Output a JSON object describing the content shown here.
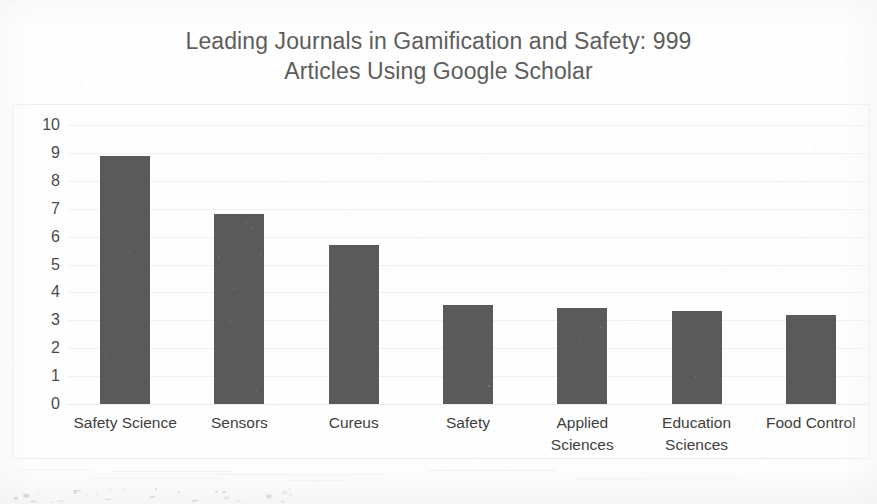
{
  "chart_data": {
    "type": "bar",
    "title": "Leading Journals in Gamification and Safety: 999 Articles Using Google Scholar",
    "title_line1": "Leading Journals in Gamification and Safety: 999",
    "title_line2": "Articles Using Google Scholar",
    "xlabel": "",
    "ylabel": "",
    "ylim": [
      0,
      10
    ],
    "grid": true,
    "legend": "none",
    "bar_color": "#5a5a5a",
    "categories": [
      "Safety Science",
      "Sensors",
      "Cureus",
      "Safety",
      "Applied Sciences",
      "Education Sciences",
      "Food Control"
    ],
    "values": [
      8.9,
      6.8,
      5.7,
      3.55,
      3.45,
      3.35,
      3.2
    ],
    "ytick_labels": [
      "10",
      "9",
      "8",
      "7",
      "6",
      "5",
      "4",
      "3",
      "2",
      "1",
      "0"
    ],
    "yticks": [
      10,
      9,
      8,
      7,
      6,
      5,
      4,
      3,
      2,
      1,
      0
    ],
    "category_lines": [
      [
        "Safety Science"
      ],
      [
        "Sensors"
      ],
      [
        "Cureus"
      ],
      [
        "Safety"
      ],
      [
        "Applied",
        "Sciences"
      ],
      [
        "Education",
        "Sciences"
      ],
      [
        "Food Control"
      ]
    ]
  }
}
